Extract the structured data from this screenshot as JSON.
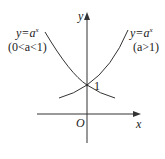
{
  "diagram": {
    "type": "exponential-function-graph",
    "axes": {
      "x_label": "x",
      "y_label": "y",
      "origin_label": "O"
    },
    "intercept_label": "1",
    "curves": [
      {
        "name": "decreasing",
        "equation_base": "y=a",
        "equation_exponent": "x",
        "condition": "(0<a<1)"
      },
      {
        "name": "increasing",
        "equation_base": "y=a",
        "equation_exponent": "x",
        "condition": "(a>1)"
      }
    ],
    "colors": {
      "stroke": "#333333",
      "text": "#222222",
      "background": "#ffffff"
    }
  }
}
